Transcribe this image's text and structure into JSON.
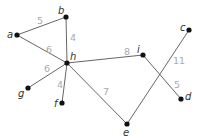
{
  "graph": {
    "nodes": [
      {
        "id": "a",
        "label": "a",
        "x": 17,
        "y": 35,
        "lx": 7,
        "ly": 38
      },
      {
        "id": "b",
        "label": "b",
        "x": 66,
        "y": 17,
        "lx": 58,
        "ly": 14
      },
      {
        "id": "h",
        "label": "h",
        "x": 67,
        "y": 63,
        "lx": 70,
        "ly": 60
      },
      {
        "id": "g",
        "label": "g",
        "x": 28,
        "y": 88,
        "lx": 18,
        "ly": 97
      },
      {
        "id": "f",
        "label": "f",
        "x": 62,
        "y": 103,
        "lx": 54,
        "ly": 107
      },
      {
        "id": "i",
        "label": "i",
        "x": 143,
        "y": 55,
        "lx": 137,
        "ly": 53
      },
      {
        "id": "c",
        "label": "c",
        "x": 189,
        "y": 30,
        "lx": 180,
        "ly": 31
      },
      {
        "id": "d",
        "label": "d",
        "x": 181,
        "y": 99,
        "lx": 185,
        "ly": 100
      },
      {
        "id": "e",
        "label": "e",
        "x": 127,
        "y": 124,
        "lx": 123,
        "ly": 136
      }
    ],
    "edges": [
      {
        "from": "a",
        "to": "b",
        "weight": "5",
        "wx": 37,
        "wy": 24
      },
      {
        "from": "b",
        "to": "h",
        "weight": "4",
        "wx": 70,
        "wy": 41
      },
      {
        "from": "a",
        "to": "h",
        "weight": "6",
        "wx": 46,
        "wy": 53
      },
      {
        "from": "h",
        "to": "g",
        "weight": "6",
        "wx": 44,
        "wy": 72
      },
      {
        "from": "h",
        "to": "f",
        "weight": "4",
        "wx": 57,
        "wy": 88
      },
      {
        "from": "h",
        "to": "i",
        "weight": "8",
        "wx": 124,
        "wy": 55
      },
      {
        "from": "h",
        "to": "e",
        "weight": "7",
        "wx": 103,
        "wy": 95
      },
      {
        "from": "i",
        "to": "d",
        "weight": "5",
        "wx": 174,
        "wy": 88
      },
      {
        "from": "e",
        "to": "c",
        "weight": "11",
        "wx": 173,
        "wy": 64
      }
    ]
  }
}
